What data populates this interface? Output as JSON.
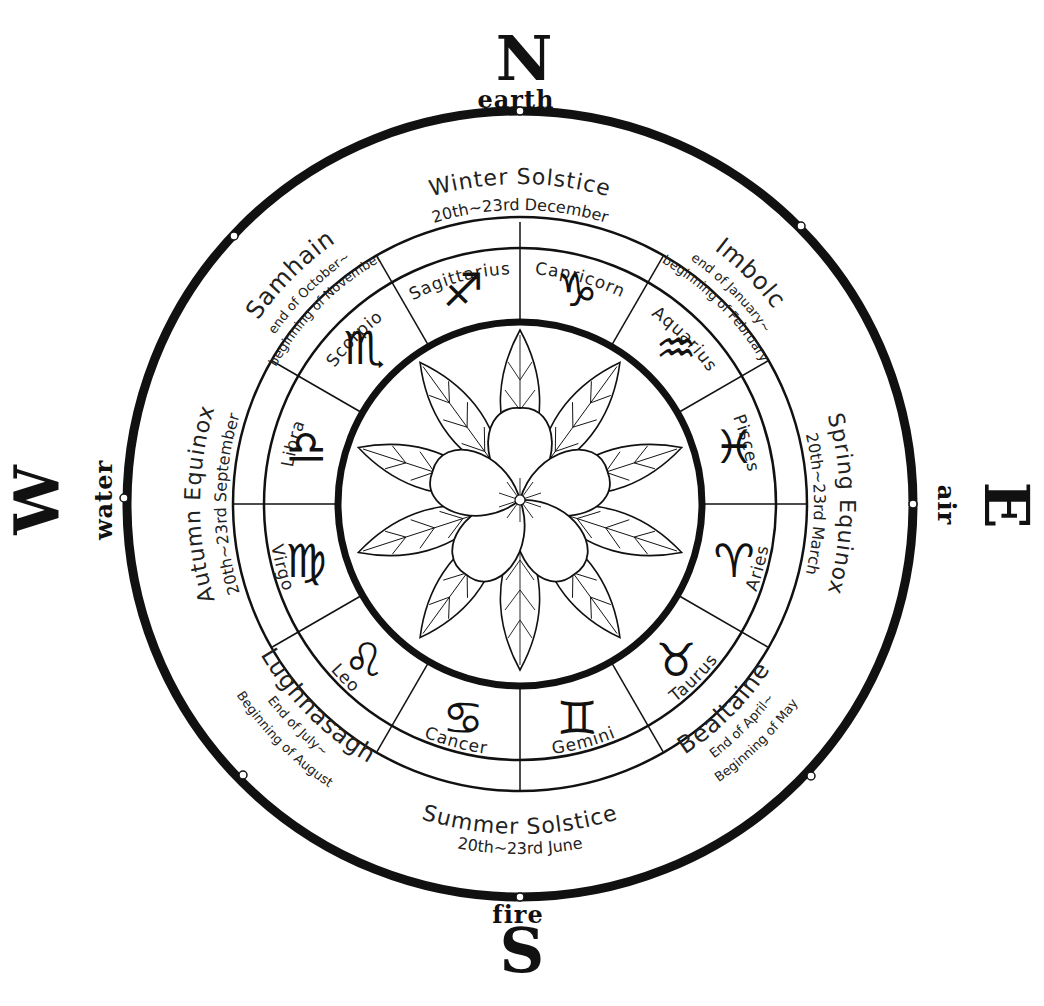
{
  "compass": {
    "north": {
      "letter": "N",
      "element": "earth"
    },
    "east": {
      "letter": "E",
      "element": "air"
    },
    "south": {
      "letter": "S",
      "element": "fire"
    },
    "west": {
      "letter": "W",
      "element": "water"
    }
  },
  "solstices_equinoxes": {
    "winter": {
      "name": "Winter Solstice",
      "date": "20th~23rd December"
    },
    "spring": {
      "name": "Spring Equinox",
      "date": "20th~23rd March"
    },
    "summer": {
      "name": "Summer Solstice",
      "date": "20th~23rd June"
    },
    "autumn": {
      "name": "Autumn Equinox",
      "date": "20th~23rd September"
    }
  },
  "festivals": {
    "imbolc": {
      "name": "Imbolc",
      "line1": "end of January~",
      "line2": "beginning of February"
    },
    "bealtaine": {
      "name": "Bealtaine",
      "line1": "End of April~",
      "line2": "Beginning of May"
    },
    "lughnasagh": {
      "name": "Lughnasagh",
      "line1": "End of July~",
      "line2": "Beginning of August"
    },
    "samhain": {
      "name": "Samhain",
      "line1": "end of October~",
      "line2": "beginning of November"
    }
  },
  "zodiac": [
    {
      "name": "Sagittarius",
      "glyph": "♐"
    },
    {
      "name": "Capricorn",
      "glyph": "♑"
    },
    {
      "name": "Aquarius",
      "glyph": "♒"
    },
    {
      "name": "Pisces",
      "glyph": "♓"
    },
    {
      "name": "Aries",
      "glyph": "♈"
    },
    {
      "name": "Taurus",
      "glyph": "♉"
    },
    {
      "name": "Gemini",
      "glyph": "♊"
    },
    {
      "name": "Cancer",
      "glyph": "♋"
    },
    {
      "name": "Leo",
      "glyph": "♌"
    },
    {
      "name": "Virgo",
      "glyph": "♍"
    },
    {
      "name": "Libra",
      "glyph": "♎"
    },
    {
      "name": "Scorpio",
      "glyph": "♏"
    }
  ],
  "center": {
    "icon": "flower-with-leaves-icon"
  },
  "colors": {
    "ink": "#111111",
    "paper": "#ffffff"
  }
}
